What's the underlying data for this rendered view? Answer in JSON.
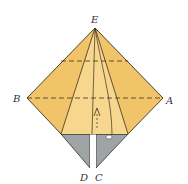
{
  "diagram": {
    "type": "origami-fold-step",
    "labels": {
      "top": "E",
      "left": "B",
      "right": "A",
      "bottom_left": "D",
      "bottom_right": "C"
    },
    "colors": {
      "paper_front": "#f2c46a",
      "paper_light": "#f7d68e",
      "paper_back": "#9ea3a6",
      "line": "#3a3020",
      "background": "#ffffff"
    },
    "annotations": {
      "arrow": "fold-up-arrow",
      "dashed_lines": [
        "valley-fold-upper",
        "valley-fold-B-A"
      ]
    }
  }
}
